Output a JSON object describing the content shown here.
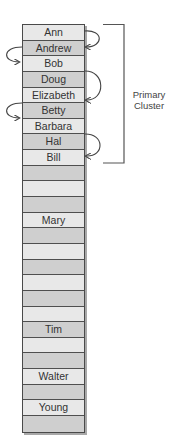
{
  "diagram": {
    "rows": [
      {
        "index": 0,
        "label": "Ann",
        "shade": "light"
      },
      {
        "index": 1,
        "label": "Andrew",
        "shade": "dark"
      },
      {
        "index": 2,
        "label": "Bob",
        "shade": "light"
      },
      {
        "index": 3,
        "label": "Doug",
        "shade": "dark"
      },
      {
        "index": 4,
        "label": "Elizabeth",
        "shade": "light"
      },
      {
        "index": 5,
        "label": "Betty",
        "shade": "dark"
      },
      {
        "index": 6,
        "label": "Barbara",
        "shade": "light"
      },
      {
        "index": 7,
        "label": "Hal",
        "shade": "dark"
      },
      {
        "index": 8,
        "label": "Bill",
        "shade": "light"
      },
      {
        "index": 9,
        "label": "",
        "shade": "dark"
      },
      {
        "index": 10,
        "label": "",
        "shade": "light"
      },
      {
        "index": 11,
        "label": "",
        "shade": "dark"
      },
      {
        "index": 12,
        "label": "Mary",
        "shade": "light"
      },
      {
        "index": 13,
        "label": "",
        "shade": "dark"
      },
      {
        "index": 14,
        "label": "",
        "shade": "light"
      },
      {
        "index": 15,
        "label": "",
        "shade": "dark"
      },
      {
        "index": 16,
        "label": "",
        "shade": "light"
      },
      {
        "index": 17,
        "label": "",
        "shade": "dark"
      },
      {
        "index": 18,
        "label": "",
        "shade": "light"
      },
      {
        "index": 19,
        "label": "Tim",
        "shade": "dark"
      },
      {
        "index": 20,
        "label": "",
        "shade": "light"
      },
      {
        "index": 21,
        "label": "",
        "shade": "dark"
      },
      {
        "index": 22,
        "label": "Walter",
        "shade": "light"
      },
      {
        "index": 23,
        "label": "",
        "shade": "dark"
      },
      {
        "index": 24,
        "label": "Young",
        "shade": "light"
      },
      {
        "index": 25,
        "label": "",
        "shade": "dark"
      }
    ],
    "probe_arrows": [
      {
        "from": "Ann",
        "to": "Andrew",
        "side": "right"
      },
      {
        "from": "Andrew",
        "to": "Bob",
        "side": "left"
      },
      {
        "from": "Doug",
        "to": "Elizabeth",
        "side": "right"
      },
      {
        "from": "Betty",
        "to": "Barbara",
        "side": "left"
      },
      {
        "from": "Hal",
        "to": "Bill",
        "side": "right"
      }
    ],
    "cluster": {
      "label_line1": "Primary",
      "label_line2": "Cluster",
      "start_row": 0,
      "end_row": 8
    },
    "colors": {
      "row_light": "#e8e8e8",
      "row_dark": "#cfcfcf",
      "border": "#4f4f4f",
      "text": "#333333",
      "arrow": "#444444"
    }
  }
}
